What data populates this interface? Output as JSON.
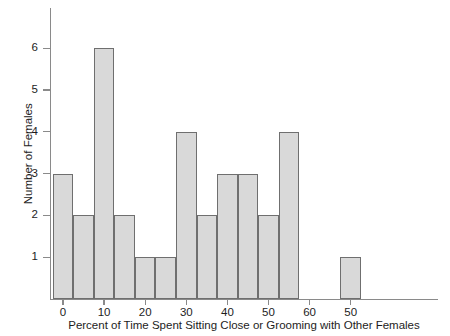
{
  "chart_data": {
    "type": "bar",
    "title": "",
    "subtitle": "",
    "xlabel": "Percent of Time Spent Sitting Close or Grooming with Other Females",
    "ylabel": "Number of Females",
    "xlim": [
      -2,
      78
    ],
    "ylim": [
      0,
      6.6
    ],
    "grid": false,
    "legend": null,
    "xticks": [
      0,
      10,
      20,
      30,
      40,
      50,
      60,
      70
    ],
    "xtick_labels": [
      "0",
      "10",
      "20",
      "30",
      "40",
      "50",
      "60",
      "50"
    ],
    "yticks": [
      1,
      2,
      3,
      4,
      5,
      6
    ],
    "ytick_labels": [
      "1",
      "2",
      "3",
      "4",
      "5",
      "6"
    ],
    "bin_width": 5,
    "bin_edges": [
      -2.5,
      2.5,
      7.5,
      12.5,
      17.5,
      22.5,
      27.5,
      32.5,
      37.5,
      42.5,
      47.5,
      52.5,
      57.5,
      62.5,
      67.5,
      72.5
    ],
    "bars": [
      {
        "x0": -2.5,
        "x1": 2.5,
        "value": 3
      },
      {
        "x0": 2.5,
        "x1": 7.5,
        "value": 2
      },
      {
        "x0": 7.5,
        "x1": 12.5,
        "value": 6
      },
      {
        "x0": 12.5,
        "x1": 17.5,
        "value": 2
      },
      {
        "x0": 17.5,
        "x1": 22.5,
        "value": 1
      },
      {
        "x0": 22.5,
        "x1": 27.5,
        "value": 1
      },
      {
        "x0": 27.5,
        "x1": 32.5,
        "value": 4
      },
      {
        "x0": 32.5,
        "x1": 37.5,
        "value": 2
      },
      {
        "x0": 37.5,
        "x1": 42.5,
        "value": 3
      },
      {
        "x0": 42.5,
        "x1": 47.5,
        "value": 3
      },
      {
        "x0": 47.5,
        "x1": 52.5,
        "value": 2
      },
      {
        "x0": 52.5,
        "x1": 57.5,
        "value": 4
      },
      {
        "x0": 57.5,
        "x1": 62.5,
        "value": 0
      },
      {
        "x0": 62.5,
        "x1": 67.5,
        "value": 0
      },
      {
        "x0": 67.5,
        "x1": 72.5,
        "value": 1
      }
    ],
    "categories": [
      "-2.5-2.5",
      "2.5-7.5",
      "7.5-12.5",
      "12.5-17.5",
      "17.5-22.5",
      "22.5-27.5",
      "27.5-32.5",
      "32.5-37.5",
      "37.5-42.5",
      "42.5-47.5",
      "47.5-52.5",
      "52.5-57.5",
      "57.5-62.5",
      "62.5-67.5",
      "67.5-72.5"
    ],
    "values": [
      3,
      2,
      6,
      2,
      1,
      1,
      4,
      2,
      3,
      3,
      2,
      4,
      0,
      0,
      1
    ],
    "colors": {
      "bar_fill": "#d9d9d9",
      "bar_border": "#6f6f6f",
      "axis": "#8a8a8a",
      "text": "#1d1d1d",
      "background": "#ffffff"
    }
  }
}
